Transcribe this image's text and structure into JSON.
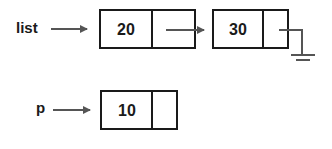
{
  "diagram": {
    "type": "linked-list",
    "colors": {
      "stroke": "#1a1a1a",
      "arrow": "#555555",
      "background": "#ffffff"
    },
    "pointers": [
      {
        "name": "list",
        "label": "list",
        "points_to": "node-20"
      },
      {
        "name": "p",
        "label": "p",
        "points_to": "node-10"
      }
    ],
    "nodes": [
      {
        "id": "node-20",
        "value": "20",
        "next": "node-30"
      },
      {
        "id": "node-30",
        "value": "30",
        "next": "null"
      },
      {
        "id": "node-10",
        "value": "10",
        "next": ""
      }
    ]
  }
}
